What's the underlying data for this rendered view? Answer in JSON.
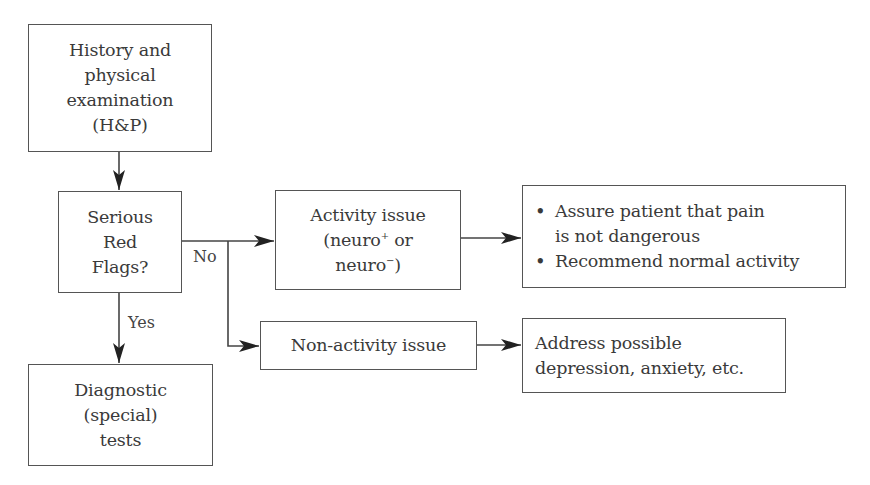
{
  "diagram": {
    "type": "flowchart",
    "nodes": {
      "history_exam": {
        "lines": [
          "History and",
          "physical",
          "examination",
          "(H&P)"
        ]
      },
      "red_flags": {
        "lines": [
          "Serious",
          "Red",
          "Flags?"
        ]
      },
      "diagnostic_tests": {
        "lines": [
          "Diagnostic",
          "(special)",
          "tests"
        ]
      },
      "activity_issue": {
        "line1": "Activity issue",
        "line2_prefix": "(neuro",
        "line2_sup": "+",
        "line2_suffix": " or",
        "line3_prefix": "neuro",
        "line3_sup": "−",
        "line3_suffix": ")"
      },
      "activity_actions": {
        "bullets": [
          "Assure patient that pain",
          "is not dangerous",
          "Recommend normal activity"
        ]
      },
      "non_activity_issue": {
        "label": "Non-activity issue"
      },
      "non_activity_actions": {
        "lines": [
          "Address possible",
          "depression, anxiety, etc."
        ]
      }
    },
    "edge_labels": {
      "no": "No",
      "yes": "Yes"
    },
    "edges": [
      {
        "from": "history_exam",
        "to": "red_flags"
      },
      {
        "from": "red_flags",
        "to": "diagnostic_tests",
        "label": "Yes"
      },
      {
        "from": "red_flags",
        "to": "activity_issue",
        "label": "No"
      },
      {
        "from": "red_flags",
        "to": "non_activity_issue",
        "label": "No"
      },
      {
        "from": "activity_issue",
        "to": "activity_actions"
      },
      {
        "from": "non_activity_issue",
        "to": "non_activity_actions"
      }
    ],
    "colors": {
      "stroke": "#555555",
      "text": "#3a3a3a",
      "background": "#ffffff"
    }
  }
}
